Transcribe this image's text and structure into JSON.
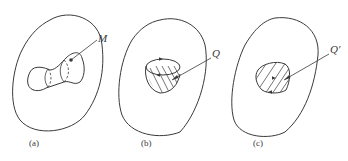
{
  "figure": {
    "panels": [
      {
        "id": "a",
        "caption": "(a)",
        "symbol": "M",
        "description": "closed outer region containing a tube-like manifold with dashed cross-sections"
      },
      {
        "id": "b",
        "caption": "(b)",
        "symbol": "Q",
        "description": "closed outer region containing a hatched cup-shaped surface with oriented boundary"
      },
      {
        "id": "c",
        "caption": "(c)",
        "symbol": "Q'",
        "description": "closed outer region containing a hatched flat disc region with oriented boundary"
      }
    ]
  },
  "colors": {
    "ink": "#3a3a3a",
    "background": "#ffffff"
  }
}
